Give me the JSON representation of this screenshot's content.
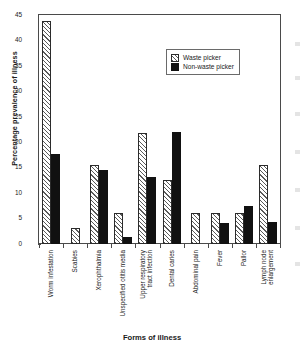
{
  "chart_data": {
    "type": "bar",
    "title": "",
    "xlabel": "Forms of illness",
    "ylabel": "Percentage prevalence of illness",
    "ylim": [
      0,
      45
    ],
    "yticks": [
      0,
      5,
      10,
      15,
      20,
      25,
      30,
      35,
      40,
      45
    ],
    "grid": false,
    "legend_position": "top-right",
    "categories": [
      "Worm infestation",
      "Scabies",
      "Xerophthalmia",
      "Unspecified otitis media",
      "Upper respiratory tract infection",
      "Dental caries",
      "Abdominal pain",
      "Fever",
      "Pallor",
      "Lymph node enlargement"
    ],
    "category_lines": [
      [
        "Worm infestation"
      ],
      [
        "Scabies"
      ],
      [
        "Xerophthalmia"
      ],
      [
        "Unspecified otitis media"
      ],
      [
        "Upper respiratory",
        "tract infection"
      ],
      [
        "Dental caries"
      ],
      [
        "Abdominal pain"
      ],
      [
        "Fever"
      ],
      [
        "Pallor"
      ],
      [
        "Lymph node",
        "enlargement"
      ]
    ],
    "series": [
      {
        "name": "Waste picker",
        "pattern": "diagonal-hatch",
        "color": "#f2f2f2",
        "values": [
          43.8,
          3.2,
          15.6,
          6.1,
          21.8,
          12.5,
          6.1,
          6.1,
          6.1,
          15.6
        ]
      },
      {
        "name": "Non-waste picker",
        "pattern": "solid",
        "color": "#111111",
        "values": [
          17.7,
          0,
          14.6,
          1.3,
          13.1,
          22.0,
          0,
          4.2,
          7.4,
          4.3
        ]
      }
    ]
  },
  "legend": {
    "items": [
      {
        "label": "Waste picker"
      },
      {
        "label": "Non-waste picker"
      }
    ]
  },
  "caption": ""
}
